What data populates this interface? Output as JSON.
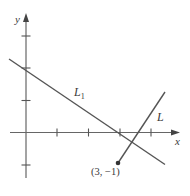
{
  "diagram": {
    "axes": {
      "x_label": "x",
      "y_label": "y",
      "x_ticks": [
        1,
        2,
        3,
        4
      ],
      "y_ticks": [
        -1,
        1,
        2,
        3
      ]
    },
    "lines": [
      {
        "name": "L1",
        "label_main": "L",
        "label_sub": "1"
      },
      {
        "name": "L",
        "label_main": "L"
      }
    ],
    "point": {
      "label": "(3, −1)",
      "x": 3,
      "y": -1
    },
    "colors": {
      "stroke": "#555555",
      "text": "#3a3a3a"
    }
  }
}
